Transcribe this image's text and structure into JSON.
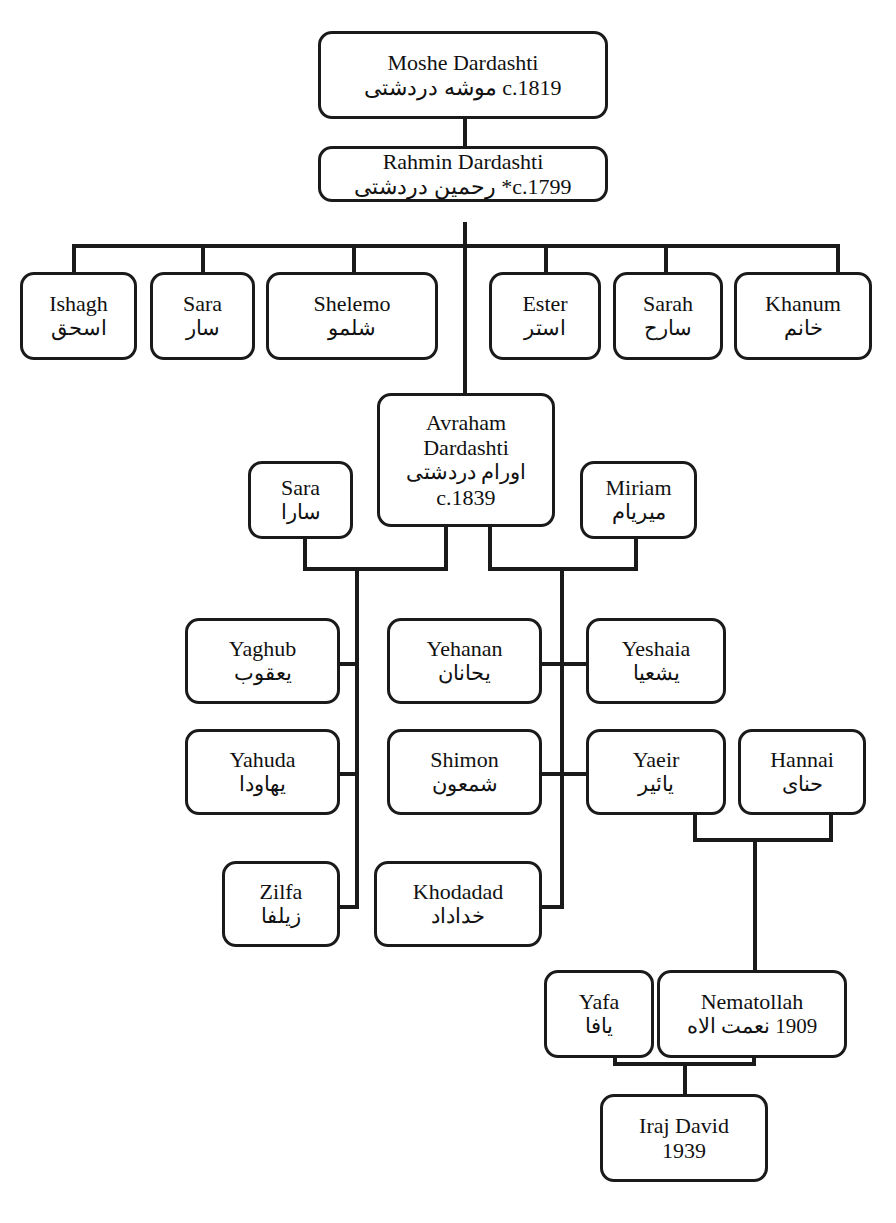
{
  "diagram": {
    "type": "genealogy-tree",
    "line_color": "#1a1a1a",
    "box_border_color": "#1a1a1a",
    "background_color": "#ffffff"
  },
  "nodes": {
    "moshe": {
      "latin": "Moshe Dardashti",
      "persian": "موشه دردشتی",
      "date": "c.1819",
      "mixed": "c.1819  موشه دردشتی"
    },
    "rahmin": {
      "latin": "Rahmin Dardashti",
      "persian": "رحمین دردشتی",
      "date": "c.1799*",
      "mixed": "c.1799*  رحمین دردشتی"
    },
    "ishagh": {
      "latin": "Ishagh",
      "persian": "اسحق"
    },
    "sara1": {
      "latin": "Sara",
      "persian": "سار"
    },
    "shelemo": {
      "latin": "Shelemo",
      "persian": "شلمو"
    },
    "ester": {
      "latin": "Ester",
      "persian": "استر"
    },
    "sarah": {
      "latin": "Sarah",
      "persian": "سارح"
    },
    "khanum": {
      "latin": "Khanum",
      "persian": "خانم"
    },
    "avraham": {
      "latin1": "Avraham",
      "latin2": "Dardashti",
      "persian": "اورام دردشتی",
      "date": "c.1839"
    },
    "sara2": {
      "latin": "Sara",
      "persian": "سارا"
    },
    "miriam": {
      "latin": "Miriam",
      "persian": "میریام"
    },
    "yaghub": {
      "latin": "Yaghub",
      "persian": "یعقوب"
    },
    "yahuda": {
      "latin": "Yahuda",
      "persian": "یهاودا"
    },
    "zilfa": {
      "latin": "Zilfa",
      "persian": "زیلفا"
    },
    "yehanan": {
      "latin": "Yehanan",
      "persian": "یحانان"
    },
    "shimon": {
      "latin": "Shimon",
      "persian": "شمعون"
    },
    "khodadad": {
      "latin": "Khodadad",
      "persian": "خداداد"
    },
    "yeshaia": {
      "latin": "Yeshaia",
      "persian": "یشعیا"
    },
    "yaeir": {
      "latin": "Yaeir",
      "persian": "یائیر"
    },
    "hannai": {
      "latin": "Hannai",
      "persian": "حنای"
    },
    "yafa": {
      "latin": "Yafa",
      "persian": "یافا"
    },
    "nematollah": {
      "latin": "Nematollah",
      "persian": "نعمت الاه",
      "date": "1909",
      "mixed": "1909 نعمت الاه"
    },
    "iraj": {
      "latin": "Iraj David",
      "date": "1939"
    }
  }
}
